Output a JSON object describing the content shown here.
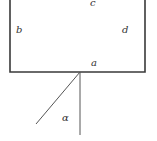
{
  "diagram": {
    "type": "geometry",
    "colors": {
      "line": "#3a3a3a",
      "label": "#333333",
      "background": "#ffffff"
    },
    "box": {
      "left": 10,
      "right": 145,
      "top": -2,
      "bottom": 72
    },
    "rays": {
      "vertex": [
        80,
        72
      ],
      "vertical_end": [
        80,
        135
      ],
      "slanted_end": [
        36,
        124
      ]
    },
    "labels": {
      "c": "c",
      "b": "b",
      "d": "d",
      "a": "a",
      "alpha": "α"
    }
  }
}
